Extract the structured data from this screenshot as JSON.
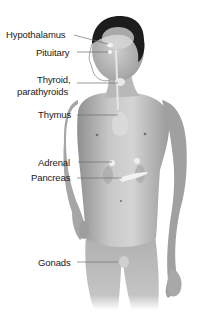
{
  "diagram": {
    "labels": [
      {
        "id": "hypothalamus",
        "text": "Hypothalamus",
        "x": 6,
        "y": 29,
        "line": [
          74,
          35,
          108,
          44
        ]
      },
      {
        "id": "pituitary",
        "text": "Pituitary",
        "x": 36,
        "y": 47,
        "line": [
          77,
          52,
          108,
          52
        ]
      },
      {
        "id": "thyroid",
        "text": "Thyroid,",
        "text2": "parathyroids",
        "x": 18,
        "y": 74,
        "line": [
          77,
          83,
          118,
          83
        ]
      },
      {
        "id": "thymus",
        "text": "Thymus",
        "x": 38,
        "y": 109,
        "line": [
          77,
          115,
          118,
          115
        ]
      },
      {
        "id": "adrenal",
        "text": "Adrenal",
        "x": 38,
        "y": 157,
        "line": [
          78,
          162,
          112,
          162
        ]
      },
      {
        "id": "pancreas",
        "text": "Pancreas",
        "x": 31,
        "y": 172,
        "line": [
          77,
          178,
          122,
          178
        ]
      },
      {
        "id": "gonads",
        "text": "Gonads",
        "x": 38,
        "y": 257,
        "line": [
          77,
          262,
          118,
          262
        ]
      }
    ],
    "colors": {
      "background": "#ffffff",
      "label_text": "#1a1a1a",
      "leader_line": "#6e6e6e",
      "skin_light": "#d9d9d9",
      "skin_mid": "#b5b5b5",
      "skin_dark": "#8a8a8a",
      "hair": "#1c1c1c",
      "gland": "#f2f2f2"
    }
  }
}
